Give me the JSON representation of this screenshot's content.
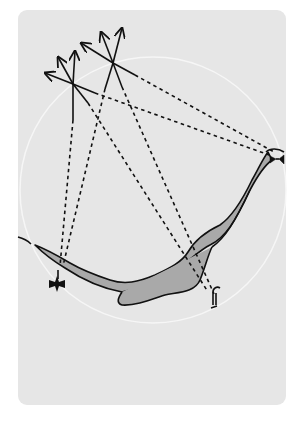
{
  "diagram": {
    "type": "coastal-navigation-fix",
    "colors": {
      "background": "#ffffff",
      "card": "#e6e6e6",
      "range_circle": "#f4f4f4",
      "shoal": "#a9a9a9",
      "ink": "#111111"
    },
    "range_circle": {
      "cx": 153,
      "cy": 190,
      "r": 133
    },
    "observers": [
      {
        "id": "A",
        "x": 73,
        "y": 84,
        "icon": "compass-arrows-icon"
      },
      {
        "id": "B",
        "x": 113,
        "y": 63,
        "icon": "compass-arrows-icon"
      }
    ],
    "landmarks": [
      {
        "id": "headland-light",
        "x": 276,
        "y": 157,
        "icon": "lighthouse-icon"
      },
      {
        "id": "church",
        "x": 57,
        "y": 284,
        "icon": "cross-icon"
      },
      {
        "id": "beacon",
        "x": 215,
        "y": 297,
        "icon": "beacon-post-icon"
      }
    ]
  }
}
